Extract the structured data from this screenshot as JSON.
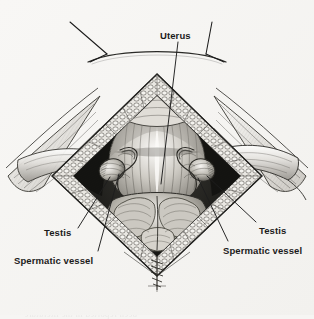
{
  "figure": {
    "kind": "medical-illustration",
    "style": "pen-and-ink stipple and crosshatch engraving, grayscale",
    "paper_color": "#f6f5f3",
    "ink_color": "#1b1b1b",
    "label_color": "#1b1b1b",
    "leader_color": "#1d1d1d"
  },
  "labels": [
    {
      "id": "uterus",
      "text": "Uterus",
      "x": 160,
      "y": 31,
      "anchor": "start",
      "leader": {
        "from_x": 178,
        "from_y": 42,
        "to_x": 161,
        "to_y": 184
      }
    },
    {
      "id": "testis-left",
      "text": "Testis",
      "x": 44,
      "y": 228,
      "anchor": "start",
      "leader": {
        "from_x": 78,
        "from_y": 228,
        "to_x": 110,
        "to_y": 177
      }
    },
    {
      "id": "spermatic-vessel-left",
      "text": "Spermatic vessel",
      "x": 14,
      "y": 256,
      "anchor": "start",
      "leader": {
        "from_x": 98,
        "from_y": 251,
        "to_x": 119,
        "to_y": 174
      }
    },
    {
      "id": "testis-right",
      "text": "Testis",
      "x": 259,
      "y": 226,
      "anchor": "start",
      "leader": {
        "from_x": 256,
        "from_y": 222,
        "to_x": 207,
        "to_y": 176
      }
    },
    {
      "id": "spermatic-vessel-right",
      "text": "Spermatic vessel",
      "x": 223,
      "y": 246,
      "anchor": "start",
      "leader": {
        "from_x": 228,
        "from_y": 241,
        "to_x": 198,
        "to_y": 178
      }
    }
  ],
  "abdominal_arc": {
    "name": "abdominal-wall-arc",
    "ticks": [
      {
        "from_x": 70,
        "from_y": 22,
        "to_x": 107,
        "to_y": 54
      },
      {
        "from_x": 107,
        "from_y": 54,
        "to_x": 90,
        "to_y": 62
      },
      {
        "from_x": 206,
        "from_y": 54,
        "to_x": 212,
        "to_y": 22
      },
      {
        "from_x": 206,
        "from_y": 54,
        "to_x": 224,
        "to_y": 62
      }
    ]
  },
  "bleed_through": {
    "note": "faint mirrored show-through text from reverse of page, illegible",
    "lines": [
      {
        "text": "obtained different in  to  and",
        "x": 62,
        "y": 4,
        "size": 8.5
      },
      {
        "text": "partially improved with  the",
        "x": 40,
        "y": 14,
        "size": 9.5
      },
      {
        "text": "the  treatment",
        "x": 72,
        "y": 27,
        "size": 9.5
      },
      {
        "text": "OPERATION MANAGEMENT ANALYSIS",
        "x": 26,
        "y": 66,
        "size": 10
      },
      {
        "text": "and the  resection of  the",
        "x": 50,
        "y": 78,
        "size": 9.5
      },
      {
        "text": "A  certain number  of  cases",
        "x": 10,
        "y": 105,
        "size": 8.5
      },
      {
        "text": "in  which  the  lesion  was",
        "x": 8,
        "y": 118,
        "size": 8.5
      },
      {
        "text": "most  commonly  observed",
        "x": 10,
        "y": 131,
        "size": 8.5
      },
      {
        "text": "with  an  associated  finding",
        "x": 10,
        "y": 148,
        "size": 8.5
      },
      {
        "text": "described  above",
        "x": 14,
        "y": 162,
        "size": 8.5
      },
      {
        "text": "series",
        "x": 22,
        "y": 192,
        "size": 8.5
      },
      {
        "text": "cases",
        "x": 248,
        "y": 108,
        "size": 8.5
      },
      {
        "text": "reported",
        "x": 244,
        "y": 126,
        "size": 8.5
      },
      {
        "text": "region",
        "x": 252,
        "y": 144,
        "size": 8.5
      },
      {
        "text": "the  bilateral  findings  were",
        "x": 20,
        "y": 272,
        "size": 8.5
      },
      {
        "text": "either  side  per  the  examination",
        "x": 14,
        "y": 286,
        "size": 8.5
      },
      {
        "text": "and  more  frequent  in  the  population",
        "x": 18,
        "y": 298,
        "size": 8.5
      },
      {
        "text": "been  reported  in  the  literature",
        "x": 24,
        "y": 309,
        "size": 8.5
      }
    ]
  }
}
